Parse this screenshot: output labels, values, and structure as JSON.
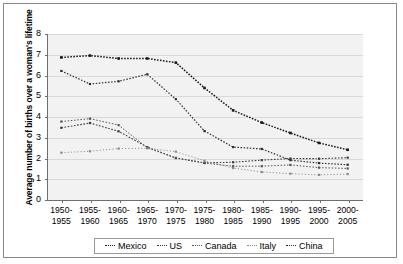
{
  "chart_data": {
    "type": "line",
    "title": "",
    "xlabel": "",
    "ylabel": "Average number of births over a woman's lifetime",
    "ylim": [
      0,
      8
    ],
    "yticks": [
      0,
      1,
      2,
      3,
      4,
      5,
      6,
      7,
      8
    ],
    "grid": true,
    "legend_position": "bottom",
    "categories": [
      "1950-1955",
      "1955-1960",
      "1960-1965",
      "1965-1970",
      "1970-1975",
      "1975-1980",
      "1980-1985",
      "1985-1990",
      "1990-1995",
      "1995-2000",
      "2000-2005"
    ],
    "categories_two_line": [
      {
        "top": "1950-",
        "bottom": "1955"
      },
      {
        "top": "1955-",
        "bottom": "1960"
      },
      {
        "top": "1960-",
        "bottom": "1965"
      },
      {
        "top": "1965-",
        "bottom": "1970"
      },
      {
        "top": "1970-",
        "bottom": "1975"
      },
      {
        "top": "1975-",
        "bottom": "1980"
      },
      {
        "top": "1980-",
        "bottom": "1985"
      },
      {
        "top": "1985-",
        "bottom": "1990"
      },
      {
        "top": "1990-",
        "bottom": "1995"
      },
      {
        "top": "1995-",
        "bottom": "2000"
      },
      {
        "top": "2000-",
        "bottom": "2005"
      }
    ],
    "series": [
      {
        "name": "Mexico",
        "values": [
          6.87,
          6.96,
          6.82,
          6.82,
          6.62,
          5.4,
          4.32,
          3.73,
          3.23,
          2.75,
          2.42
        ]
      },
      {
        "name": "US",
        "values": [
          3.48,
          3.71,
          3.31,
          2.55,
          2.02,
          1.79,
          1.82,
          1.92,
          2.0,
          1.99,
          2.04
        ]
      },
      {
        "name": "Canada",
        "values": [
          3.78,
          3.92,
          3.61,
          2.52,
          2.03,
          1.78,
          1.63,
          1.63,
          1.69,
          1.56,
          1.52
        ]
      },
      {
        "name": "Italy",
        "values": [
          2.28,
          2.35,
          2.48,
          2.49,
          2.33,
          1.89,
          1.54,
          1.35,
          1.27,
          1.21,
          1.25
        ]
      },
      {
        "name": "China",
        "values": [
          6.22,
          5.59,
          5.72,
          6.06,
          4.86,
          3.32,
          2.55,
          2.46,
          1.92,
          1.78,
          1.7
        ]
      }
    ]
  },
  "legend": {
    "items": [
      {
        "label": "Mexico"
      },
      {
        "label": "US"
      },
      {
        "label": "Canada"
      },
      {
        "label": "Italy"
      },
      {
        "label": "China"
      }
    ]
  },
  "axes": {
    "y_title": "Average number of births over a woman's lifetime"
  },
  "colors": {
    "plot_background": "#f2f2f2",
    "gridline": "#d9d9d9",
    "axis": "#6e6e6e",
    "series_mexico": "#1a1a1a",
    "series_us": "#3a3a3a",
    "series_canada": "#555555",
    "series_italy": "#8a8a8a",
    "series_china": "#2e2e2e",
    "frame_border": "#8a8a8a"
  }
}
